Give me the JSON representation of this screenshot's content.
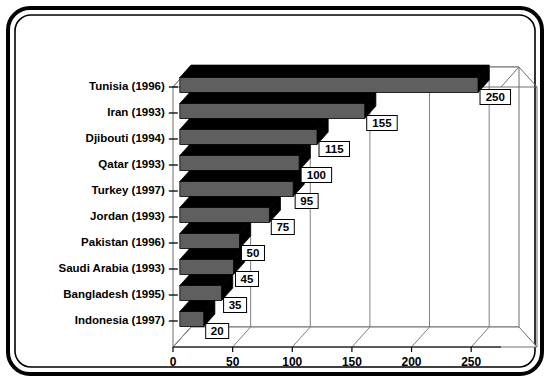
{
  "frame": {
    "border_color": "#000000",
    "background": "#ffffff"
  },
  "chart_data": {
    "type": "bar",
    "orientation": "horizontal",
    "style": "3d",
    "title": "",
    "subtitle": "",
    "xlabel": "",
    "ylabel": "",
    "xlim": [
      0,
      275
    ],
    "xticks": [
      0,
      50,
      100,
      150,
      200,
      250
    ],
    "xtick_labels": [
      "0",
      "50",
      "100",
      "150",
      "200",
      "250"
    ],
    "grid": true,
    "legend": false,
    "categories": [
      "Tunisia (1996)",
      "Iran (1993)",
      "Djibouti (1994)",
      "Qatar (1993)",
      "Turkey (1997)",
      "Jordan (1993)",
      "Pakistan (1996)",
      "Saudi Arabia (1993)",
      "Bangladesh (1995)",
      "Indonesia (1997)"
    ],
    "values": [
      250,
      155,
      115,
      100,
      95,
      75,
      50,
      45,
      35,
      20
    ],
    "data_labels": [
      "250",
      "155",
      "115",
      "100",
      "95",
      "75",
      "50",
      "45",
      "35",
      "20"
    ],
    "bar_face_color": "#5f5f5f",
    "bar_top_color": "#000000",
    "bar_edge_color": "#000000",
    "plot_bg_color": "#ffffff",
    "grid_color": "#808080"
  }
}
